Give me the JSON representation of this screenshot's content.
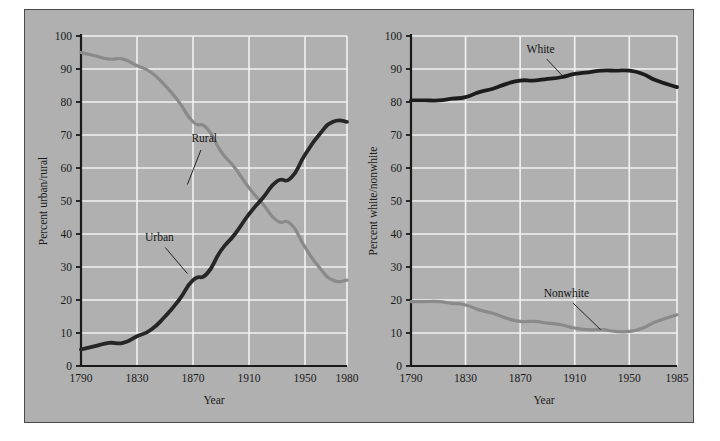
{
  "figure": {
    "background_color": "#b0b0b0",
    "frame_color": "#4a4a4a",
    "grid_color": "#f2f2f2",
    "axis_color": "#1a1a1a"
  },
  "chart_data": [
    {
      "type": "line",
      "id": "urban-rural",
      "title": "",
      "xlabel": "Year",
      "ylabel": "Percent urban/rural",
      "xlim": [
        1790,
        1980
      ],
      "ylim": [
        0,
        100
      ],
      "grid": true,
      "legend_position": "inline-annotation",
      "xticks": [
        1790,
        1830,
        1870,
        1910,
        1950,
        1980
      ],
      "xtick_labels": [
        "1790",
        "1830",
        "1870",
        "1910",
        "1950",
        "1980"
      ],
      "yticks": [
        0,
        10,
        20,
        30,
        40,
        50,
        60,
        70,
        80,
        90,
        100
      ],
      "ytick_labels": [
        "0",
        "10",
        "20",
        "30",
        "40",
        "50",
        "60",
        "70",
        "80",
        "90",
        "100"
      ],
      "series": [
        {
          "name": "Rural",
          "color": "#8a8a8a",
          "line_width": 3.2,
          "label_x": 1878,
          "label_y": 68,
          "leader_to_x": 1866,
          "leader_to_y": 55,
          "x": [
            1790,
            1800,
            1810,
            1820,
            1830,
            1840,
            1850,
            1860,
            1870,
            1880,
            1890,
            1900,
            1910,
            1920,
            1930,
            1940,
            1950,
            1960,
            1970,
            1980
          ],
          "y": [
            95,
            94,
            93,
            93,
            91,
            89,
            85,
            80,
            74,
            72,
            65,
            60,
            54,
            49,
            44,
            43,
            36,
            30,
            26,
            26
          ]
        },
        {
          "name": "Urban",
          "color": "#262626",
          "line_width": 3.8,
          "label_x": 1846,
          "label_y": 38,
          "leader_to_x": 1866,
          "leader_to_y": 28,
          "x": [
            1790,
            1800,
            1810,
            1820,
            1830,
            1840,
            1850,
            1860,
            1870,
            1880,
            1890,
            1900,
            1910,
            1920,
            1930,
            1940,
            1950,
            1960,
            1970,
            1980
          ],
          "y": [
            5,
            6,
            7,
            7,
            9,
            11,
            15,
            20,
            26,
            28,
            35,
            40,
            46,
            51,
            56,
            57,
            64,
            70,
            74,
            74
          ]
        }
      ]
    },
    {
      "type": "line",
      "id": "white-nonwhite",
      "title": "",
      "xlabel": "Year",
      "ylabel": "Percent white/nonwhite",
      "xlim": [
        1790,
        1985
      ],
      "ylim": [
        0,
        100
      ],
      "grid": true,
      "legend_position": "inline-annotation",
      "xticks": [
        1790,
        1830,
        1870,
        1910,
        1950,
        1985
      ],
      "xtick_labels": [
        "1790",
        "1830",
        "1870",
        "1910",
        "1950",
        "1985"
      ],
      "yticks": [
        0,
        10,
        20,
        30,
        40,
        50,
        60,
        70,
        80,
        90,
        100
      ],
      "ytick_labels": [
        "0",
        "10",
        "20",
        "30",
        "40",
        "50",
        "60",
        "70",
        "80",
        "90",
        "100"
      ],
      "series": [
        {
          "name": "White",
          "color": "#1c1c1c",
          "line_width": 3.8,
          "label_x": 1885,
          "label_y": 95,
          "leader_to_x": 1902,
          "leader_to_y": 87.5,
          "x": [
            1790,
            1800,
            1810,
            1820,
            1830,
            1840,
            1850,
            1860,
            1870,
            1880,
            1890,
            1900,
            1910,
            1920,
            1930,
            1940,
            1950,
            1960,
            1970,
            1985
          ],
          "y": [
            80.5,
            80.5,
            80.5,
            81,
            81.5,
            83,
            84,
            85.5,
            86.5,
            86.5,
            87,
            87.5,
            88.5,
            89,
            89.5,
            89.5,
            89.5,
            88.5,
            86.5,
            84.5
          ]
        },
        {
          "name": "Nonwhite",
          "color": "#8a8a8a",
          "line_width": 3.2,
          "label_x": 1904,
          "label_y": 21,
          "leader_to_x": 1929,
          "leader_to_y": 11,
          "x": [
            1790,
            1800,
            1810,
            1820,
            1830,
            1840,
            1850,
            1860,
            1870,
            1880,
            1890,
            1900,
            1910,
            1920,
            1930,
            1940,
            1950,
            1960,
            1970,
            1985
          ],
          "y": [
            19.5,
            19.5,
            19.5,
            19,
            18.5,
            17,
            16,
            14.5,
            13.5,
            13.5,
            13,
            12.5,
            11.5,
            11,
            11,
            10.5,
            10.5,
            11.5,
            13.5,
            15.5
          ]
        }
      ]
    }
  ]
}
